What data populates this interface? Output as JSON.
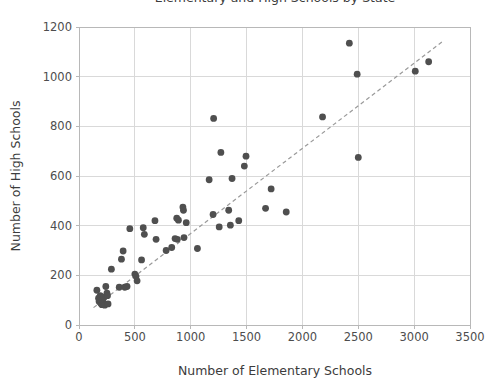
{
  "chart_data": {
    "type": "scatter",
    "title": "Elementary and High Schools by State",
    "xlabel": "Number of Elementary Schools",
    "ylabel": "Number of High Schools",
    "xlim": [
      0,
      3500
    ],
    "ylim": [
      0,
      1200
    ],
    "xticks": [
      0,
      500,
      1000,
      1500,
      2000,
      2500,
      3000,
      3500
    ],
    "yticks": [
      0,
      200,
      400,
      600,
      800,
      1000,
      1200
    ],
    "grid": true,
    "legend": "none",
    "marker_color": "#4f4f4f",
    "trendline_color": "#9a9a9a",
    "trendline_style": "dashed",
    "trendline": {
      "x1": 130,
      "y1": 70,
      "x2": 3250,
      "y2": 1140
    },
    "points": [
      [
        160,
        140
      ],
      [
        175,
        108
      ],
      [
        180,
        95
      ],
      [
        190,
        118
      ],
      [
        195,
        88
      ],
      [
        200,
        100
      ],
      [
        205,
        82
      ],
      [
        215,
        92
      ],
      [
        220,
        85
      ],
      [
        225,
        112
      ],
      [
        230,
        80
      ],
      [
        240,
        155
      ],
      [
        250,
        128
      ],
      [
        255,
        118
      ],
      [
        260,
        85
      ],
      [
        290,
        225
      ],
      [
        360,
        152
      ],
      [
        380,
        265
      ],
      [
        395,
        298
      ],
      [
        410,
        152
      ],
      [
        430,
        155
      ],
      [
        455,
        388
      ],
      [
        500,
        205
      ],
      [
        510,
        196
      ],
      [
        520,
        178
      ],
      [
        560,
        262
      ],
      [
        575,
        392
      ],
      [
        585,
        365
      ],
      [
        680,
        420
      ],
      [
        690,
        345
      ],
      [
        780,
        300
      ],
      [
        830,
        312
      ],
      [
        860,
        348
      ],
      [
        875,
        430
      ],
      [
        880,
        345
      ],
      [
        890,
        422
      ],
      [
        930,
        475
      ],
      [
        935,
        462
      ],
      [
        940,
        352
      ],
      [
        960,
        412
      ],
      [
        1060,
        308
      ],
      [
        1165,
        585
      ],
      [
        1200,
        445
      ],
      [
        1205,
        832
      ],
      [
        1255,
        395
      ],
      [
        1270,
        695
      ],
      [
        1340,
        462
      ],
      [
        1355,
        402
      ],
      [
        1370,
        590
      ],
      [
        1430,
        420
      ],
      [
        1480,
        640
      ],
      [
        1495,
        680
      ],
      [
        1670,
        470
      ],
      [
        1720,
        548
      ],
      [
        1855,
        455
      ],
      [
        2180,
        838
      ],
      [
        2420,
        1135
      ],
      [
        2490,
        1010
      ],
      [
        2500,
        675
      ],
      [
        3010,
        1022
      ],
      [
        3130,
        1060
      ]
    ]
  }
}
